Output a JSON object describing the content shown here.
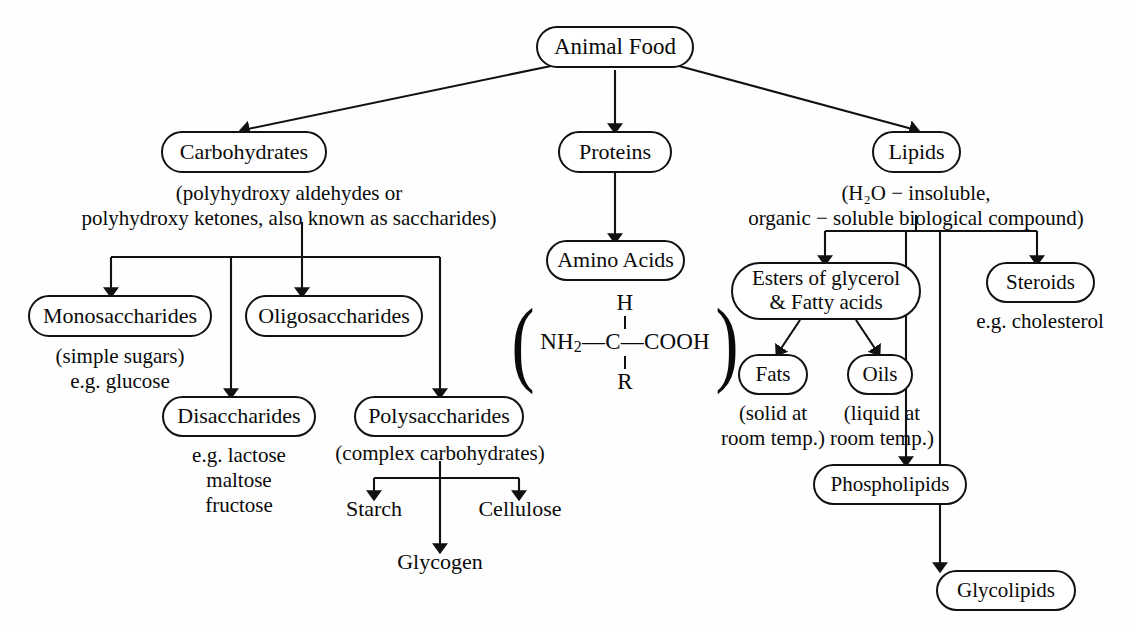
{
  "diagram": {
    "root": {
      "label": "Animal Food"
    },
    "nodes": {
      "carbohydrates": "Carbohydrates",
      "proteins": "Proteins",
      "lipids": "Lipids",
      "amino_acids": "Amino Acids",
      "monosaccharides": "Monosaccharides",
      "oligosaccharides": "Oligosaccharides",
      "disaccharides": "Disaccharides",
      "polysaccharides": "Polysaccharides",
      "esters": "Esters of glycerol\n& Fatty acids",
      "steroids": "Steroids",
      "fats": "Fats",
      "oils": "Oils",
      "phospholipids": "Phospholipids",
      "glycolipids": "Glycolipids"
    },
    "captions": {
      "carbohydrates_note": "(polyhydroxy aldehydes or\npolyhydroxy ketones, also known as saccharides)",
      "lipids_note": "(H₂O − insoluble,\norganic − soluble biological compound)",
      "monosaccharides_note": "(simple sugars)\ne.g. glucose",
      "disaccharides_note": "e.g. lactose\nmaltose\nfructose",
      "polysaccharides_note": "(complex carbohydrates)",
      "steroids_note": "e.g. cholesterol",
      "fats_note": "(solid at\nroom temp.)",
      "oils_note": "(liquid at\nroom temp.)"
    },
    "leaves": {
      "starch": "Starch",
      "glycogen": "Glycogen",
      "cellulose": "Cellulose"
    },
    "formula": {
      "open_paren": "(",
      "close_paren": ")",
      "top": "H",
      "middle_left": "NH",
      "middle_left_sub": "2",
      "middle_rest": "—C—COOH",
      "bottom": "R"
    },
    "colors": {
      "line": "#111111",
      "text": "#0a0a0a",
      "background": "#fefefe"
    }
  }
}
